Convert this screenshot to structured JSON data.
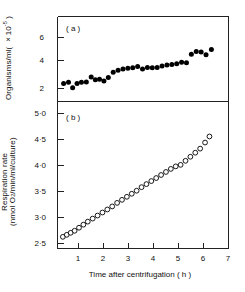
{
  "figure": {
    "panels": [
      {
        "tag": "( a )"
      },
      {
        "tag": "( b )"
      }
    ],
    "xlabel": "Time after centrifugation ( h )",
    "ylabel_a_main": "Organisms/ml",
    "ylabel_a_unit": "( ×10",
    "ylabel_a_exp": "-5",
    "ylabel_a_close": " )",
    "ylabel_b_line1": "Respiration rate",
    "ylabel_b_line2_pre": "(nmol O",
    "ylabel_b_line2_sub": "2",
    "ylabel_b_line2_post": "/min/ml/culture)",
    "xticks": [
      "1",
      "2",
      "3",
      "4",
      "5",
      "6",
      "7"
    ],
    "yticks_a": [
      "2",
      "4",
      "6"
    ],
    "yticks_b": [
      "2·5",
      "3·0",
      "3·5",
      "4·0",
      "4·5",
      "5·0"
    ]
  },
  "chart_data": [
    {
      "type": "scatter",
      "panel": "a",
      "title": "( a )",
      "xlabel": "Time after centrifugation ( h )",
      "ylabel": "Organisms/ml ( ×10-5 )",
      "xlim": [
        0,
        7
      ],
      "ylim": [
        1.6,
        6.9
      ],
      "xticks": [
        1,
        2,
        3,
        4,
        5,
        6,
        7
      ],
      "yticks": [
        2,
        4,
        6
      ],
      "grid": false,
      "legend": "none",
      "marker": "filled-circle",
      "marker_color": "#000000",
      "x": [
        0.25,
        0.45,
        0.62,
        0.8,
        0.98,
        1.18,
        1.38,
        1.55,
        1.72,
        1.9,
        2.08,
        2.28,
        2.48,
        2.68,
        2.88,
        3.08,
        3.28,
        3.48,
        3.68,
        3.88,
        4.08,
        4.28,
        4.48,
        4.68,
        4.88,
        5.08,
        5.28,
        5.48,
        5.68,
        5.88,
        6.08,
        6.3
      ],
      "y": [
        2.72,
        2.8,
        2.45,
        2.72,
        2.8,
        2.82,
        3.12,
        2.95,
        2.98,
        2.88,
        3.1,
        3.42,
        3.55,
        3.62,
        3.68,
        3.7,
        3.78,
        3.62,
        3.72,
        3.7,
        3.72,
        3.82,
        3.88,
        3.9,
        3.95,
        4.05,
        4.02,
        4.55,
        4.72,
        4.68,
        4.52,
        4.85
      ]
    },
    {
      "type": "scatter",
      "panel": "b",
      "title": "( b )",
      "xlabel": "Time after centrifugation ( h )",
      "ylabel": "Respiration rate (nmol O2/min/ml/culture)",
      "xlim": [
        0,
        7
      ],
      "ylim": [
        2.35,
        5.25
      ],
      "xticks": [
        1,
        2,
        3,
        4,
        5,
        6,
        7
      ],
      "yticks": [
        2.5,
        3.0,
        3.5,
        4.0,
        4.5,
        5.0
      ],
      "grid": false,
      "legend": "none",
      "marker": "open-circle",
      "marker_color": "#000000",
      "x": [
        0.22,
        0.38,
        0.54,
        0.7,
        0.88,
        1.06,
        1.24,
        1.44,
        1.64,
        1.84,
        2.04,
        2.24,
        2.44,
        2.64,
        2.84,
        3.04,
        3.24,
        3.44,
        3.64,
        3.84,
        4.04,
        4.24,
        4.44,
        4.64,
        4.84,
        5.04,
        5.24,
        5.44,
        5.64,
        5.84,
        6.04,
        6.22
      ],
      "y": [
        2.58,
        2.62,
        2.66,
        2.7,
        2.76,
        2.82,
        2.88,
        2.94,
        3.0,
        3.06,
        3.12,
        3.18,
        3.25,
        3.31,
        3.37,
        3.43,
        3.49,
        3.56,
        3.62,
        3.68,
        3.74,
        3.8,
        3.86,
        3.92,
        3.97,
        4.0,
        4.08,
        4.16,
        4.24,
        4.32,
        4.44,
        4.56
      ]
    }
  ]
}
